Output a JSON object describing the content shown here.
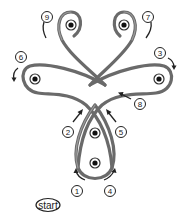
{
  "diagram": {
    "type": "knot-lacing-sequence",
    "start_label": "start",
    "steps": [
      {
        "n": "1",
        "x": 77,
        "y": 191
      },
      {
        "n": "2",
        "x": 68,
        "y": 132
      },
      {
        "n": "3",
        "x": 160,
        "y": 53
      },
      {
        "n": "4",
        "x": 110,
        "y": 191
      },
      {
        "n": "5",
        "x": 121,
        "y": 132
      },
      {
        "n": "6",
        "x": 21,
        "y": 57
      },
      {
        "n": "7",
        "x": 148,
        "y": 17
      },
      {
        "n": "8",
        "x": 140,
        "y": 104
      },
      {
        "n": "9",
        "x": 47,
        "y": 17
      }
    ],
    "holes": [
      {
        "name": "top-left",
        "x": 71,
        "y": 25
      },
      {
        "name": "top-right",
        "x": 124,
        "y": 25
      },
      {
        "name": "left",
        "x": 35,
        "y": 79
      },
      {
        "name": "right",
        "x": 159,
        "y": 79
      },
      {
        "name": "center-upper",
        "x": 95,
        "y": 133
      },
      {
        "name": "center-lower",
        "x": 95,
        "y": 163
      }
    ],
    "colors": {
      "cord": "#6a6a6a",
      "ink": "#222222",
      "background": "#ffffff"
    }
  }
}
